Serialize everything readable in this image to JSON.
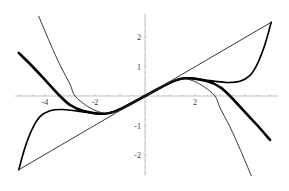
{
  "chart_data": {
    "type": "line",
    "title": "",
    "xlabel": "",
    "ylabel": "",
    "xlim": [
      -5.2,
      5.3
    ],
    "ylim": [
      -2.7,
      2.8
    ],
    "grid": false,
    "legend": null,
    "x_ticks": [
      {
        "value": -4,
        "label": "-4"
      },
      {
        "value": -2,
        "label": "-2"
      },
      {
        "value": 2,
        "label": "2"
      }
    ],
    "y_ticks": [
      {
        "value": 2,
        "label": "2"
      },
      {
        "value": 1,
        "label": "1"
      },
      {
        "value": -1,
        "label": "-1"
      },
      {
        "value": -2,
        "label": "-2"
      }
    ],
    "series": [
      {
        "name": "thick-curve",
        "stroke_width": 2.6,
        "color": "#000000",
        "points": [
          [
            -5.05,
            1.46
          ],
          [
            -4.5,
            1.0
          ],
          [
            -4.0,
            0.55
          ],
          [
            -3.4,
            0.0
          ],
          [
            -3.0,
            -0.3
          ],
          [
            -2.5,
            -0.5
          ],
          [
            -1.6,
            -0.6
          ],
          [
            -1.0,
            -0.45
          ],
          [
            0,
            0
          ],
          [
            1.0,
            0.45
          ],
          [
            1.6,
            0.6
          ],
          [
            2.5,
            0.5
          ],
          [
            3.0,
            0.3
          ],
          [
            3.4,
            0.0
          ],
          [
            4.0,
            -0.55
          ],
          [
            4.5,
            -1.0
          ],
          [
            5.0,
            -1.49
          ]
        ]
      },
      {
        "name": "medium-curve",
        "stroke_width": 1.6,
        "color": "#000000",
        "points": [
          [
            -5.05,
            -2.5
          ],
          [
            -4.8,
            -1.75
          ],
          [
            -4.5,
            -1.1
          ],
          [
            -4.2,
            -0.7
          ],
          [
            -3.8,
            -0.5
          ],
          [
            -3.3,
            -0.46
          ],
          [
            -2.6,
            -0.52
          ],
          [
            -2.0,
            -0.6
          ],
          [
            -1.6,
            -0.6
          ],
          [
            -1.0,
            -0.45
          ],
          [
            0,
            0
          ],
          [
            1.0,
            0.45
          ],
          [
            1.6,
            0.6
          ],
          [
            2.0,
            0.6
          ],
          [
            2.6,
            0.52
          ],
          [
            3.3,
            0.46
          ],
          [
            3.8,
            0.5
          ],
          [
            4.2,
            0.7
          ],
          [
            4.5,
            1.1
          ],
          [
            4.8,
            1.75
          ],
          [
            5.05,
            2.5
          ]
        ]
      },
      {
        "name": "thin-curve",
        "stroke_width": 0.9,
        "color": "#222222",
        "points": [
          [
            -4.25,
            2.7
          ],
          [
            -3.8,
            1.8
          ],
          [
            -3.4,
            1.05
          ],
          [
            -3.0,
            0.4
          ],
          [
            -2.8,
            0.0
          ],
          [
            -2.3,
            -0.35
          ],
          [
            -1.8,
            -0.55
          ],
          [
            -1.4,
            -0.58
          ],
          [
            -1.0,
            -0.45
          ],
          [
            0,
            0
          ],
          [
            1.0,
            0.45
          ],
          [
            1.4,
            0.58
          ],
          [
            1.8,
            0.55
          ],
          [
            2.3,
            0.35
          ],
          [
            2.8,
            0.0
          ],
          [
            3.0,
            -0.4
          ],
          [
            3.4,
            -1.05
          ],
          [
            3.8,
            -1.8
          ],
          [
            4.25,
            2.7
          ]
        ]
      },
      {
        "name": "line",
        "stroke_width": 0.9,
        "color": "#222222",
        "points": [
          [
            -5.05,
            -2.5
          ],
          [
            5.05,
            2.5
          ]
        ]
      }
    ]
  }
}
